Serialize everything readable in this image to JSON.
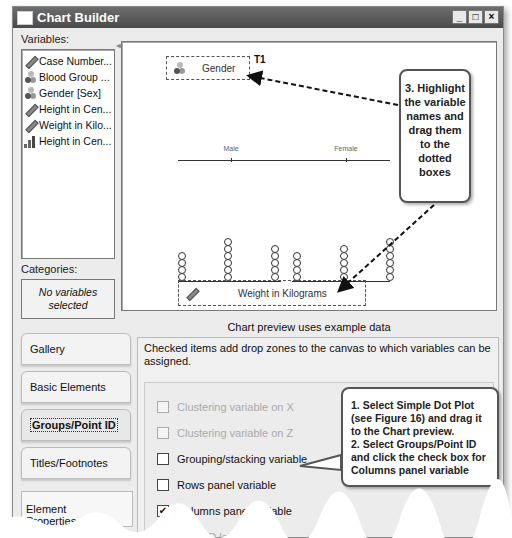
{
  "window": {
    "title": "Chart Builder",
    "controls": {
      "minimize": "_",
      "maximize": "□",
      "close": "×"
    }
  },
  "variables": {
    "label": "Variables:",
    "items": [
      {
        "icon": "scale-ruler-icon",
        "label": "Case Number..."
      },
      {
        "icon": "nominal-icon",
        "label": "Blood Group ..."
      },
      {
        "icon": "nominal-icon",
        "label": "Gender [Sex]"
      },
      {
        "icon": "scale-ruler-icon",
        "label": "Height in Cen..."
      },
      {
        "icon": "scale-ruler-icon",
        "label": "Weight in Kilo..."
      },
      {
        "icon": "ordinal-bars-icon",
        "label": "Height in Cen..."
      }
    ]
  },
  "categories": {
    "label": "Categories:",
    "empty_text": "No variables selected"
  },
  "canvas": {
    "panel_zone": {
      "label": "Gender",
      "tag": "T1"
    },
    "x_zone": {
      "label": "Weight in Kilograms"
    },
    "panels": [
      {
        "label": "Male",
        "dot_counts": [
          4,
          6,
          5
        ]
      },
      {
        "label": "Female",
        "dot_counts": [
          4,
          5,
          6
        ]
      }
    ]
  },
  "preview_note": "Chart preview uses example data",
  "tabs": [
    {
      "label": "Gallery",
      "active": false
    },
    {
      "label": "Basic Elements",
      "active": false
    },
    {
      "label": "Groups/Point ID",
      "active": true
    },
    {
      "label": "Titles/Footnotes",
      "active": false
    }
  ],
  "element_properties_button": "Element Properties...",
  "options_panel": {
    "description": "Checked items add drop zones to the canvas to which variables can be assigned.",
    "options": [
      {
        "label": "Clustering variable on X",
        "checked": false,
        "enabled": false
      },
      {
        "label": "Clustering variable on Z",
        "checked": false,
        "enabled": false
      },
      {
        "label": "Grouping/stacking variable",
        "checked": false,
        "enabled": true
      },
      {
        "label": "Rows panel variable",
        "checked": false,
        "enabled": true
      },
      {
        "label": "Columns panel variable",
        "checked": true,
        "enabled": true
      },
      {
        "label": "Point ID label",
        "checked": false,
        "enabled": false
      }
    ]
  },
  "callouts": {
    "step3": "3. Highlight the variable names and drag them to the dotted boxes",
    "step3_lines": [
      "3. Highlight",
      "the variable",
      "names and",
      "drag them",
      "to the",
      "dotted",
      "boxes"
    ],
    "step1_lines": [
      "1. Select Simple Dot Plot",
      "(see Figure 16) and drag it",
      "to the Chart preview.",
      "2. Select Groups/Point ID",
      "and click the check box for",
      "Columns panel variable"
    ]
  },
  "cut_off_text": "Options..."
}
